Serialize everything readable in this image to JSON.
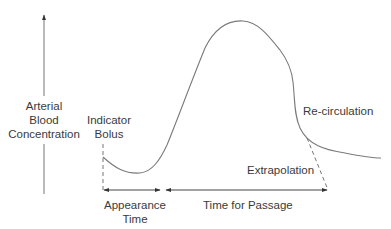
{
  "diagram": {
    "y_axis_label": [
      "Arterial",
      "Blood",
      "Concentration"
    ],
    "indicator_label": [
      "Indicator",
      "Bolus"
    ],
    "recirculation_label": "Re-circulation",
    "extrapolation_label": "Extrapolation",
    "appearance_time_label": [
      "Appearance",
      "Time"
    ],
    "time_for_passage_label": "Time for Passage",
    "colors": {
      "line": "#7a7a7a",
      "text": "#3a3a3a",
      "arrow": "#333333"
    }
  }
}
